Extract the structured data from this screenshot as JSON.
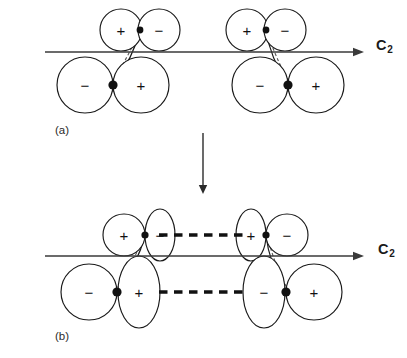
{
  "figure": {
    "background_color": "#ffffff",
    "outline_color": "#1a1a1a",
    "axis_color": "#3a3a3a",
    "node_color": "#111111",
    "width": 407,
    "height": 358
  },
  "panels": [
    {
      "id": "a",
      "caption": "(a)",
      "caption_x": 55,
      "caption_y": 124,
      "axis": {
        "label_text": "C",
        "label_sub": "2",
        "label_x": 376,
        "label_y": 37,
        "line_x1": 45,
        "line_x2": 355,
        "line_y": 52,
        "arrow_tip_x": 364
      },
      "lobe_style": "circle",
      "interaction_dashes": [],
      "groups": [
        {
          "id": "a-left",
          "node_top": {
            "cx": 140,
            "cy": 30,
            "r": 3.4
          },
          "node_bottom": {
            "cx": 113,
            "cy": 85,
            "r": 4.6
          },
          "lobes": [
            {
              "name": "upper-left-lobe",
              "sign": "+",
              "cx": 121,
              "cy": 30,
              "rx": 21,
              "ry": 21
            },
            {
              "name": "upper-right-lobe",
              "sign": "−",
              "cx": 159,
              "cy": 30,
              "rx": 21,
              "ry": 21
            },
            {
              "name": "lower-left-lobe",
              "sign": "−",
              "cx": 85,
              "cy": 85,
              "rx": 28,
              "ry": 28
            },
            {
              "name": "lower-right-lobe",
              "sign": "+",
              "cx": 141,
              "cy": 85,
              "rx": 28,
              "ry": 28
            }
          ]
        },
        {
          "id": "a-right",
          "node_top": {
            "cx": 266,
            "cy": 30,
            "r": 3.4
          },
          "node_bottom": {
            "cx": 288,
            "cy": 85,
            "r": 4.6
          },
          "lobes": [
            {
              "name": "upper-left-lobe",
              "sign": "+",
              "cx": 247,
              "cy": 30,
              "rx": 21,
              "ry": 21
            },
            {
              "name": "upper-right-lobe",
              "sign": "−",
              "cx": 285,
              "cy": 30,
              "rx": 21,
              "ry": 21
            },
            {
              "name": "lower-left-lobe",
              "sign": "−",
              "cx": 260,
              "cy": 85,
              "rx": 28,
              "ry": 28
            },
            {
              "name": "lower-right-lobe",
              "sign": "+",
              "cx": 316,
              "cy": 85,
              "rx": 28,
              "ry": 28
            }
          ]
        }
      ]
    },
    {
      "id": "b",
      "caption": "(b)",
      "caption_x": 55,
      "caption_y": 330,
      "axis": {
        "label_text": "C",
        "label_sub": "2",
        "label_x": 378,
        "label_y": 241,
        "line_x1": 45,
        "line_x2": 355,
        "line_y": 256,
        "arrow_tip_x": 364
      },
      "lobe_style": "mixed-circle-ellipse",
      "interaction_dashes": [
        {
          "name": "upper-interaction",
          "x1": 159,
          "x2": 247,
          "y": 235
        },
        {
          "name": "lower-interaction",
          "x1": 159,
          "x2": 243,
          "y": 292
        }
      ],
      "groups": [
        {
          "id": "b-left",
          "node_top": {
            "cx": 145,
            "cy": 235,
            "r": 3.6
          },
          "node_bottom": {
            "cx": 117,
            "cy": 292,
            "r": 4.6
          },
          "lobes": [
            {
              "name": "upper-left-lobe",
              "sign": "+",
              "cx": 124,
              "cy": 235,
              "rx": 21,
              "ry": 21
            },
            {
              "name": "upper-right-lobe",
              "sign": "−",
              "cx": 160,
              "cy": 235,
              "rx": 15,
              "ry": 26
            },
            {
              "name": "lower-left-lobe",
              "sign": "−",
              "cx": 89,
              "cy": 292,
              "rx": 28,
              "ry": 28
            },
            {
              "name": "lower-right-lobe",
              "sign": "+",
              "cx": 139,
              "cy": 292,
              "rx": 21,
              "ry": 36
            }
          ]
        },
        {
          "id": "b-right",
          "node_top": {
            "cx": 266,
            "cy": 235,
            "r": 3.6
          },
          "node_bottom": {
            "cx": 286,
            "cy": 292,
            "r": 4.6
          },
          "lobes": [
            {
              "name": "upper-left-lobe",
              "sign": "+",
              "cx": 251,
              "cy": 235,
              "rx": 15,
              "ry": 26
            },
            {
              "name": "upper-right-lobe",
              "sign": "−",
              "cx": 287,
              "cy": 235,
              "rx": 21,
              "ry": 21
            },
            {
              "name": "lower-left-lobe",
              "sign": "−",
              "cx": 264,
              "cy": 292,
              "rx": 21,
              "ry": 36
            },
            {
              "name": "lower-right-lobe",
              "sign": "+",
              "cx": 314,
              "cy": 292,
              "rx": 28,
              "ry": 28
            }
          ]
        }
      ]
    }
  ],
  "transform_arrow": {
    "name": "downward-transform-arrow",
    "x": 203,
    "y_start": 133,
    "y_end": 186,
    "tip_y": 194
  },
  "signs": {
    "positive": "+",
    "negative": "−"
  }
}
